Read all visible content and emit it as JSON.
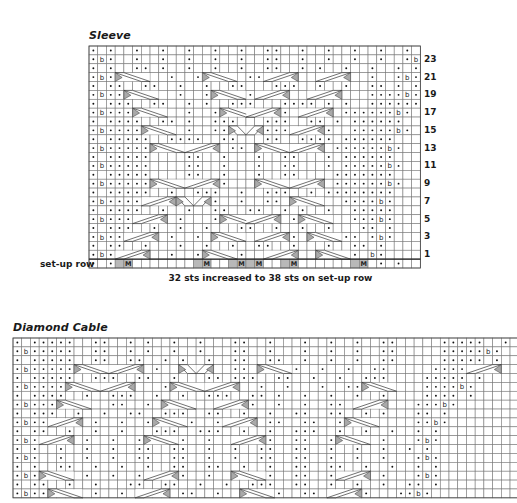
{
  "sleeve": {
    "title": "Sleeve",
    "setup_row_label": "set-up row",
    "footnote": "32 sts increased to 38 sts on set-up row",
    "columns": 38,
    "row_numbers": [
      "23",
      "21",
      "19",
      "17",
      "15",
      "13",
      "11",
      "9",
      "7",
      "5",
      "3",
      "1"
    ],
    "legend_symbols": {
      ".": "purl-dot",
      "b": "twisted-stitch-b",
      " ": "knit-blank",
      "M": "make-one-shaded",
      "#": "no-stitch-shaded"
    },
    "rows": [
      ". .  .  .  .  .  .  ..  .  .  .  .  . .",
      ".b.  .  .  .  .  .  ..  .  .  .  .  .b.",
      ". .  .. .  .  .  .  ..  . .  .  .  . .",
      ".b.  ..  .  .  .  ..  ..  .  .  .  .b.",
      ". ..  ..  .  .  ..   ...  .  .  .. . .",
      ".b..  .   .  .   ..  ..  .  .   ....b.",
      ". ...  ..  . .  ...   .... . .  ......",
      ".b...   .  .  .  ..  ..  .   ......b.",
      ". ....  .. .  ...   ...  .. . ......",
      ".b....  .  .  ..    ... .  .  .....b.",
      ". .....  ....  ..   ..  .... ......",
      ".b.....  .  ..  ..  ..   .  ......b.",
      ". .....    ..  .   .  ..   . ......",
      ".b.....    ..  .   .  ..   . .....b.",
      ". .....    ..  .   .  ..    .......",
      ".b.....   ..  ..    ..  ..  ......b.",
      ". .....  .  ...  .  ...  . ........",
      ".b.... .  .  ..  .  .. .  .  ....b.",
      ". ....  .  .  ..  ..  . .  .  .....",
      ".b...  .  .   .  .. .  .  .   ...b.",
      ". ...  .  .  .   ..  .  .  .   .. .",
      ".b..  .  .  .  ..  ..  .  .  .. .b.",
      ". ..  .   .  .  .  ..  .   .  .. .",
      ".b.   .  .  .   ..  .  .   .  . b.",
      ". .#M       #M  #M#M  #M      #M . ."
    ],
    "cables": [
      {
        "row": 3,
        "col": 3,
        "span": 4,
        "dir": "right"
      },
      {
        "row": 3,
        "col": 26,
        "span": 4,
        "dir": "left"
      },
      {
        "row": 3,
        "col": 13,
        "span": 4,
        "dir": "right"
      },
      {
        "row": 3,
        "col": 20,
        "span": 4,
        "dir": "left"
      },
      {
        "row": 5,
        "col": 4,
        "span": 4,
        "dir": "right"
      },
      {
        "row": 5,
        "col": 14,
        "span": 4,
        "dir": "right"
      },
      {
        "row": 5,
        "col": 19,
        "span": 4,
        "dir": "left"
      },
      {
        "row": 5,
        "col": 25,
        "span": 4,
        "dir": "left"
      },
      {
        "row": 7,
        "col": 5,
        "span": 4,
        "dir": "right"
      },
      {
        "row": 7,
        "col": 15,
        "span": 4,
        "dir": "right"
      },
      {
        "row": 7,
        "col": 18,
        "span": 4,
        "dir": "left"
      },
      {
        "row": 7,
        "col": 24,
        "span": 4,
        "dir": "left"
      },
      {
        "row": 9,
        "col": 6,
        "span": 4,
        "dir": "right"
      },
      {
        "row": 9,
        "col": 16,
        "span": 2,
        "dir": "right"
      },
      {
        "row": 9,
        "col": 18,
        "span": 2,
        "dir": "left"
      },
      {
        "row": 9,
        "col": 23,
        "span": 4,
        "dir": "left"
      },
      {
        "row": 11,
        "col": 7,
        "span": 4,
        "dir": "right"
      },
      {
        "row": 11,
        "col": 11,
        "span": 4,
        "dir": "left"
      },
      {
        "row": 11,
        "col": 19,
        "span": 4,
        "dir": "right"
      },
      {
        "row": 11,
        "col": 23,
        "span": 4,
        "dir": "left"
      },
      {
        "row": 15,
        "col": 7,
        "span": 4,
        "dir": "right"
      },
      {
        "row": 15,
        "col": 11,
        "span": 4,
        "dir": "left"
      },
      {
        "row": 15,
        "col": 19,
        "span": 4,
        "dir": "right"
      },
      {
        "row": 15,
        "col": 23,
        "span": 4,
        "dir": "left"
      },
      {
        "row": 17,
        "col": 6,
        "span": 4,
        "dir": "left"
      },
      {
        "row": 17,
        "col": 10,
        "span": 2,
        "dir": "right"
      },
      {
        "row": 17,
        "col": 12,
        "span": 2,
        "dir": "left"
      },
      {
        "row": 17,
        "col": 23,
        "span": 4,
        "dir": "right"
      },
      {
        "row": 19,
        "col": 5,
        "span": 4,
        "dir": "left"
      },
      {
        "row": 19,
        "col": 15,
        "span": 4,
        "dir": "right"
      },
      {
        "row": 19,
        "col": 18,
        "span": 4,
        "dir": "left"
      },
      {
        "row": 19,
        "col": 24,
        "span": 4,
        "dir": "right"
      },
      {
        "row": 21,
        "col": 4,
        "span": 4,
        "dir": "left"
      },
      {
        "row": 21,
        "col": 14,
        "span": 4,
        "dir": "right"
      },
      {
        "row": 21,
        "col": 19,
        "span": 4,
        "dir": "left"
      },
      {
        "row": 21,
        "col": 25,
        "span": 4,
        "dir": "right"
      },
      {
        "row": 23,
        "col": 3,
        "span": 4,
        "dir": "left"
      },
      {
        "row": 23,
        "col": 13,
        "span": 4,
        "dir": "right"
      },
      {
        "row": 23,
        "col": 20,
        "span": 4,
        "dir": "left"
      },
      {
        "row": 23,
        "col": 26,
        "span": 4,
        "dir": "right"
      }
    ]
  },
  "diamond_cable": {
    "title": "Diamond Cable",
    "columns": 58,
    "rows": [
      ". .....  ..  . .  .  .   ..  .   .  .  .  ..     .....  .",
      ".b.....  ..  . .  .  .   ..  .   .  .  .  ..     .....b.",
      ". .....  ..  ..  . .  .  ..  ..  .  .  .  ..     ..... .",
      ".b.....  ..  .  .  .  .  ..  .  .  .  .  ..     .....b.",
      ". .....  ...  ..  .   .. ...  ..  .  .  ...    ..... .",
      ".b.....  ..  .   .  ..  ..  .  .   .  ..  .    ....b.",
      ". ....  .  ...  .  .  ...  .. .  .  .  .  .    .... .",
      ".b....  .  ..  .   ..  ..  .  .  .  ..  .     ...b.",
      ". ...  .  .  ..  ...  ..  .  .  ..  ..  . .   .. .",
      ".b..  .  .  .  ..  ..  .  .  ..  ..  .  .     ..b.",
      ". ..  .  .  .   ...  ...  .  .  ...  .  .  .  . .",
      ".b.  .  .  .  ..  ..  .  .  ..  ..  .  .  .   .b.",
      ". .  .  .  .  ..  ..  .  .  ..  ..  .  .  .  . .",
      ".b.  .  .  .  ..  ..  .  .  ..  ..  .  .  .   .b.",
      ". .  ..  .  .  .  ..  ..  .  .  ..  ..  .  .  . .",
      ".b.  .  .  .  ..  ..  .  .  ..  ..  .  .  .   .b.",
      ". ..  .  .   ..  ..  .  .  ...  ..  .  .  .  .. .",
      ".b..  .  .  .  ..  ..  .  .  ..  ..  .  .   ..b."
    ],
    "cables": [
      {
        "row": 3,
        "col": 7,
        "span": 4,
        "dir": "right"
      },
      {
        "row": 3,
        "col": 11,
        "span": 4,
        "dir": "left"
      },
      {
        "row": 3,
        "col": 19,
        "span": 2,
        "dir": "right"
      },
      {
        "row": 3,
        "col": 21,
        "span": 2,
        "dir": "left"
      },
      {
        "row": 3,
        "col": 28,
        "span": 4,
        "dir": "right"
      },
      {
        "row": 3,
        "col": 52,
        "span": 4,
        "dir": "left"
      },
      {
        "row": 5,
        "col": 6,
        "span": 4,
        "dir": "right"
      },
      {
        "row": 5,
        "col": 10,
        "span": 4,
        "dir": "left"
      },
      {
        "row": 5,
        "col": 18,
        "span": 4,
        "dir": "right"
      },
      {
        "row": 5,
        "col": 22,
        "span": 4,
        "dir": "left"
      },
      {
        "row": 5,
        "col": 40,
        "span": 4,
        "dir": "right"
      },
      {
        "row": 7,
        "col": 5,
        "span": 4,
        "dir": "right"
      },
      {
        "row": 7,
        "col": 17,
        "span": 4,
        "dir": "right"
      },
      {
        "row": 7,
        "col": 23,
        "span": 4,
        "dir": "left"
      },
      {
        "row": 7,
        "col": 39,
        "span": 4,
        "dir": "left"
      },
      {
        "row": 9,
        "col": 4,
        "span": 4,
        "dir": "left"
      },
      {
        "row": 9,
        "col": 16,
        "span": 4,
        "dir": "right"
      },
      {
        "row": 9,
        "col": 24,
        "span": 4,
        "dir": "left"
      },
      {
        "row": 9,
        "col": 38,
        "span": 4,
        "dir": "right"
      },
      {
        "row": 11,
        "col": 3,
        "span": 4,
        "dir": "left"
      },
      {
        "row": 11,
        "col": 15,
        "span": 4,
        "dir": "right"
      },
      {
        "row": 11,
        "col": 25,
        "span": 4,
        "dir": "left"
      },
      {
        "row": 11,
        "col": 37,
        "span": 4,
        "dir": "right"
      },
      {
        "row": 15,
        "col": 3,
        "span": 4,
        "dir": "right"
      },
      {
        "row": 15,
        "col": 15,
        "span": 4,
        "dir": "left"
      },
      {
        "row": 15,
        "col": 25,
        "span": 4,
        "dir": "right"
      },
      {
        "row": 15,
        "col": 37,
        "span": 4,
        "dir": "left"
      },
      {
        "row": 17,
        "col": 4,
        "span": 4,
        "dir": "right"
      },
      {
        "row": 17,
        "col": 14,
        "span": 4,
        "dir": "left"
      },
      {
        "row": 17,
        "col": 26,
        "span": 4,
        "dir": "right"
      },
      {
        "row": 17,
        "col": 36,
        "span": 4,
        "dir": "left"
      }
    ]
  }
}
